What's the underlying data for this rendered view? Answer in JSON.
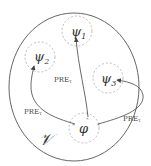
{
  "diagram": {
    "region_label": "𝒱",
    "nodes": [
      {
        "id": "psi1",
        "label": "ψ",
        "sub": "1"
      },
      {
        "id": "psi2",
        "label": "ψ",
        "sub": "2"
      },
      {
        "id": "psi3",
        "label": "ψ",
        "sub": "3"
      },
      {
        "id": "phi",
        "label": "φ"
      }
    ],
    "edges": [
      {
        "from": "phi",
        "to": "psi1",
        "label": "PREτ"
      },
      {
        "from": "phi",
        "to": "psi2",
        "label": "PREτ"
      },
      {
        "from": "phi",
        "to": "psi3",
        "label": "PREτ"
      }
    ],
    "edge_label_main": "PRE",
    "edge_label_sub": "τ",
    "colors": {
      "outline": "#555555",
      "dashed": "#bbbbbb",
      "arrow": "#444444"
    }
  }
}
